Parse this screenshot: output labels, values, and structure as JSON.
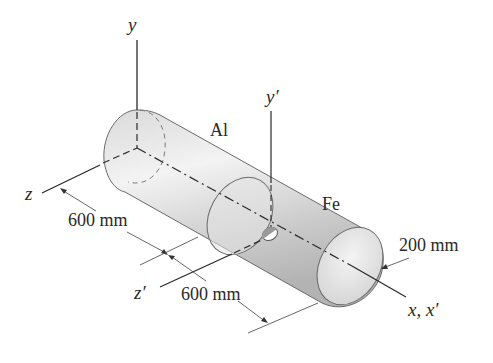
{
  "diagram": {
    "type": "composite-cylinder-3d",
    "axes": {
      "y": "y",
      "y_prime": "y′",
      "z": "z",
      "z_prime": "z′",
      "x": "x, x′"
    },
    "segments": [
      {
        "material": "Al",
        "length_label": "600 mm"
      },
      {
        "material": "Fe",
        "length_label": "600 mm"
      }
    ],
    "diameter_label": "200 mm",
    "colors": {
      "cylinder_fill_light": "#f2f2f2",
      "cylinder_fill_dark": "#b8b8b8",
      "line": "#2a2a2a",
      "text": "#2a2a2a"
    }
  }
}
